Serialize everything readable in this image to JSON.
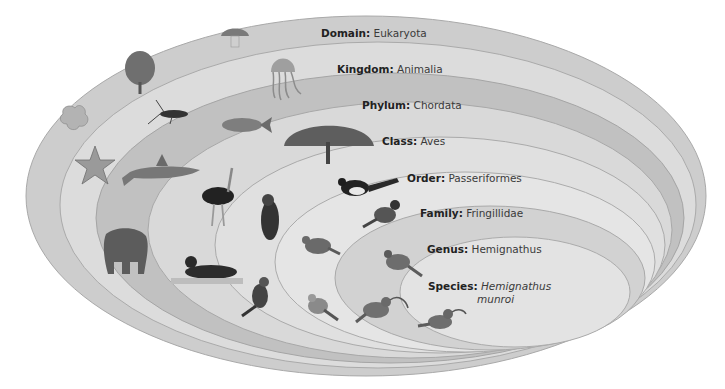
{
  "diagram": {
    "type": "nested-ellipses",
    "levels": [
      {
        "rank": "Domain",
        "name": "Eukaryota",
        "italic": false,
        "fill": "#cfcfcf"
      },
      {
        "rank": "Kingdom",
        "name": "Animalia",
        "italic": false,
        "fill": "#dedede"
      },
      {
        "rank": "Phylum",
        "name": "Chordata",
        "italic": false,
        "fill": "#c2c2c2"
      },
      {
        "rank": "Class",
        "name": "Aves",
        "italic": false,
        "fill": "#dadada"
      },
      {
        "rank": "Order",
        "name": "Passeriformes",
        "italic": false,
        "fill": "#e2e2e2"
      },
      {
        "rank": "Family",
        "name": "Fringillidae",
        "italic": false,
        "fill": "#e6e6e6"
      },
      {
        "rank": "Genus",
        "name": "Hemignathus",
        "italic": false,
        "fill": "#d3d3d3"
      },
      {
        "rank": "Species",
        "name_line1": "Hemignathus",
        "name_line2": "munroi",
        "italic": true,
        "fill": "#e4e4e4"
      }
    ],
    "organisms": {
      "domain": [
        "amoeba",
        "tree",
        "mushroom"
      ],
      "kingdom": [
        "starfish",
        "insect",
        "jellyfish"
      ],
      "phylum": [
        "shark",
        "fish",
        "elephant"
      ],
      "class": [
        "peacock",
        "ostrich",
        "loon"
      ],
      "order": [
        "parrot",
        "magpie",
        "kingfisher"
      ],
      "family": [
        "sparrow",
        "bullfinch",
        "goldfinch"
      ],
      "genus": [
        "honeycreeper-brown",
        "honeycreeper-curved-bill"
      ],
      "species": [
        "akiapolaau"
      ]
    }
  }
}
